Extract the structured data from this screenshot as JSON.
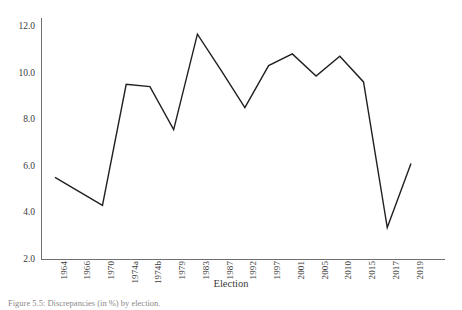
{
  "figure": {
    "caption": "Figure 5.5: Discrepancies (in %) by election.",
    "background_color": "#ffffff",
    "line_color": "#231f20",
    "axis_color": "#6f6f6f"
  },
  "chart_data": {
    "type": "line",
    "title": "",
    "xlabel": "Election",
    "ylabel": "",
    "categories": [
      "1964",
      "1966",
      "1970",
      "1974a",
      "1974b",
      "1979",
      "1983",
      "1987",
      "1992",
      "1997",
      "2001",
      "2005",
      "2010",
      "2015",
      "2017",
      "2019"
    ],
    "values": [
      5.5,
      4.9,
      4.3,
      9.5,
      9.4,
      7.55,
      11.65,
      10.1,
      8.5,
      10.3,
      10.8,
      9.85,
      10.7,
      9.6,
      3.35,
      6.1
    ],
    "ylim": [
      2.0,
      12.0
    ],
    "yticks": [
      "2.0",
      "4.0",
      "6.0",
      "8.0",
      "10.0",
      "12.0"
    ],
    "ytick_values": [
      2.0,
      4.0,
      6.0,
      8.0,
      10.0,
      12.0
    ],
    "grid": false,
    "legend": "none",
    "series": [
      {
        "name": "Discrepancy",
        "values": [
          5.5,
          4.9,
          4.3,
          9.5,
          9.4,
          7.55,
          11.65,
          10.1,
          8.5,
          10.3,
          10.8,
          9.85,
          10.7,
          9.6,
          3.35,
          6.1
        ]
      }
    ]
  }
}
